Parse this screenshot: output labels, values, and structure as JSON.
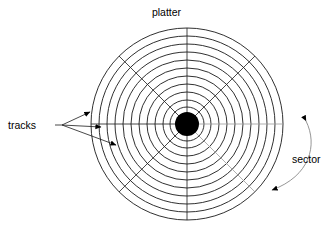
{
  "diagram": {
    "title_label": "platter",
    "tracks_label": "tracks",
    "sector_label": "sector",
    "background_color": "#ffffff",
    "line_color": "#1a1a1a",
    "faint_line_color": "#9a9a9a",
    "hub_color": "#000000",
    "center": {
      "x": 187,
      "y": 124
    },
    "hub_radius": 12,
    "track_count": 11,
    "track_radii": [
      96,
      88,
      80,
      72,
      64,
      56,
      48,
      40,
      32,
      24,
      17
    ],
    "spoke_count": 6,
    "spoke_angles_deg": [
      0,
      45,
      90,
      135,
      180,
      225,
      270,
      315
    ],
    "sector_count": 8,
    "labels": [
      {
        "name": "platter",
        "text": "platter",
        "x": 187,
        "y": 13
      },
      {
        "name": "tracks",
        "text": "tracks",
        "x": 32,
        "y": 128
      },
      {
        "name": "sector",
        "text": "sector",
        "x": 312,
        "y": 160
      }
    ],
    "tracks_leader_origin": {
      "x": 62,
      "y": 125
    },
    "tracks_arrow_targets": [
      {
        "x": 93,
        "y": 113
      },
      {
        "x": 104,
        "y": 127
      },
      {
        "x": 120,
        "y": 147
      }
    ],
    "sector_arc_start": {
      "x": 307,
      "y": 120
    },
    "sector_arc_end": {
      "x": 269,
      "y": 192
    }
  }
}
